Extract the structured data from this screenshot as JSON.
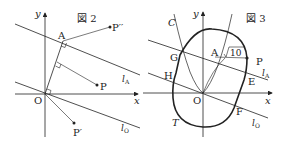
{
  "figure2": {
    "title": "図 2",
    "axis_x": "x",
    "axis_y": "y",
    "origin": "O",
    "points": {
      "A": "A",
      "P": "P",
      "P_prime": "P′",
      "P_double_prime": "P′′"
    },
    "lines": {
      "lA": "l",
      "lA_sub": "A",
      "lO": "l",
      "lO_sub": "O"
    }
  },
  "figure3": {
    "title": "図 3",
    "axis_x": "x",
    "axis_y": "y",
    "origin": "O",
    "curve_C": "C",
    "curve_T": "T",
    "points": {
      "A": "A",
      "P": "P",
      "E": "E",
      "F": "F",
      "G": "G",
      "H": "H"
    },
    "sqrt_label": "10",
    "lines": {
      "lA": "l",
      "lA_sub": "A",
      "lO": "l",
      "lO_sub": "O"
    }
  },
  "colors": {
    "ink": "#222222",
    "background": "#ffffff"
  }
}
